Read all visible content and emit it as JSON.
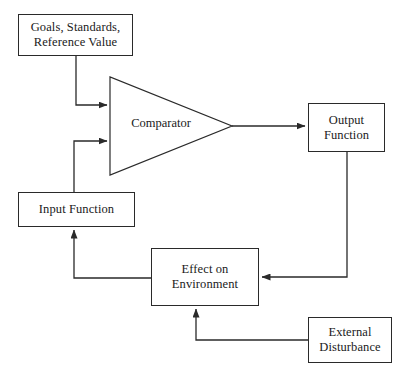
{
  "diagram": {
    "type": "block-diagram",
    "canvas": {
      "width": 406,
      "height": 383,
      "background": "#ffffff"
    },
    "stroke_color": "#2a2a2a",
    "text_color": "#1a1a1a",
    "nodes": [
      {
        "id": "goals",
        "label": "Goals, Standards,\nReference Value",
        "shape": "rectangle",
        "x": 18,
        "y": 14,
        "width": 115,
        "height": 42
      },
      {
        "id": "comparator",
        "label": "Comparator",
        "shape": "triangle",
        "x": 110,
        "y": 77,
        "width": 122,
        "height": 98
      },
      {
        "id": "output_function",
        "label": "Output\nFunction",
        "shape": "rectangle",
        "x": 308,
        "y": 103,
        "width": 77,
        "height": 49
      },
      {
        "id": "input_function",
        "label": "Input Function",
        "shape": "rectangle",
        "x": 18,
        "y": 192,
        "width": 117,
        "height": 35
      },
      {
        "id": "effect_on_environment",
        "label": "Effect on\nEnvironment",
        "shape": "rectangle",
        "x": 151,
        "y": 248,
        "width": 108,
        "height": 58
      },
      {
        "id": "external_disturbance",
        "label": "External\nDisturbance",
        "shape": "rectangle",
        "x": 308,
        "y": 317,
        "width": 84,
        "height": 46
      }
    ],
    "edges": [
      {
        "id": "goals-to-comparator",
        "from": "goals",
        "to": "comparator",
        "arrow": true
      },
      {
        "id": "input-to-comparator",
        "from": "input_function",
        "to": "comparator",
        "arrow": true
      },
      {
        "id": "comparator-to-output",
        "from": "comparator",
        "to": "output_function",
        "arrow": true
      },
      {
        "id": "output-to-effect",
        "from": "output_function",
        "to": "effect_on_environment",
        "arrow": true
      },
      {
        "id": "effect-to-input",
        "from": "effect_on_environment",
        "to": "input_function",
        "arrow": true
      },
      {
        "id": "disturbance-to-effect",
        "from": "external_disturbance",
        "to": "effect_on_environment",
        "arrow": true
      }
    ]
  }
}
